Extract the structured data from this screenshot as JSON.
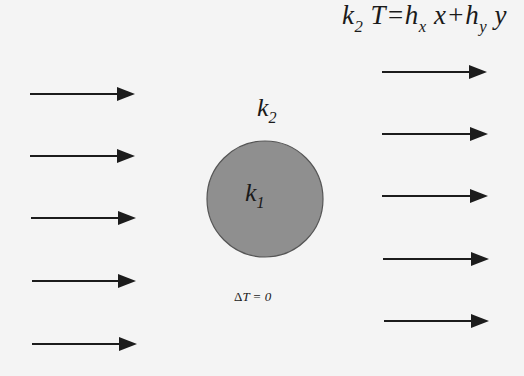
{
  "diagram": {
    "background_color": "#f4f4f4",
    "inclusion": {
      "shape": "circle",
      "center": [
        265,
        199
      ],
      "radius": 58,
      "fill_color": "#8f8f8f",
      "stroke_color": "#555555",
      "label_main": "k",
      "label_sub": "1"
    },
    "matrix_label": {
      "main": "k",
      "sub": "2"
    },
    "boundary_condition_label": {
      "delta": "Δ",
      "text": "T = 0"
    },
    "far_field_equation": {
      "k": "k",
      "k_sub": "2",
      "T_eq": " T=h",
      "hx_sub": "x",
      "x_plus_h": " x+h",
      "hy_sub": "y",
      "y_end": " y"
    },
    "arrow_color": "#1c1c1c",
    "left_arrows": [
      {
        "y": 94,
        "x1": 30,
        "x2": 135
      },
      {
        "y": 156,
        "x1": 30,
        "x2": 135
      },
      {
        "y": 218,
        "x1": 31,
        "x2": 136
      },
      {
        "y": 281,
        "x1": 32,
        "x2": 136
      },
      {
        "y": 344,
        "x1": 32,
        "x2": 137
      }
    ],
    "right_arrows": [
      {
        "y": 72,
        "x1": 382,
        "x2": 487
      },
      {
        "y": 134,
        "x1": 382,
        "x2": 488
      },
      {
        "y": 196,
        "x1": 382,
        "x2": 488
      },
      {
        "y": 259,
        "x1": 383,
        "x2": 489
      },
      {
        "y": 321,
        "x1": 384,
        "x2": 489
      }
    ]
  }
}
